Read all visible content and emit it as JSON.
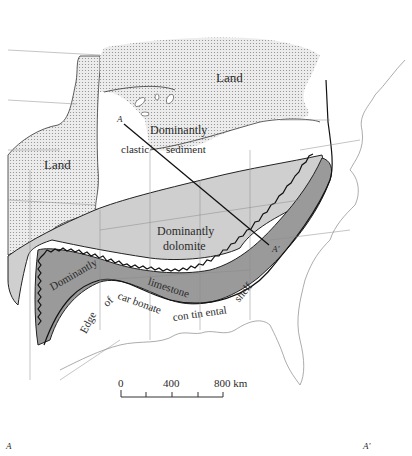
{
  "map": {
    "type": "paleogeographic facies map",
    "region": "Eastern and central United States",
    "colors": {
      "land_stipple": "#c8c8c8",
      "clastic": "#ffffff",
      "dolomite": "#cfcfcf",
      "limestone": "#9a9a9a",
      "boundary": "#222222",
      "state_lines": "#7a7a7a"
    },
    "labels": {
      "land_north": "Land",
      "land_west": "Land",
      "clastic_line1": "Dominantly",
      "clastic_line2a": "clastic",
      "clastic_line2b": "sediment",
      "dolomite_line1": "Dominantly",
      "dolomite_line2": "dolomite",
      "limestone_a": "Dominantly",
      "limestone_b": "limestone",
      "shelf_1": "Edge",
      "shelf_2": "of",
      "shelf_3": "car bonate",
      "shelf_4": "con tin ental",
      "shelf_5": "shelf",
      "section_start": "A",
      "section_end": "A'"
    },
    "scale_bar": {
      "ticks": [
        "0",
        "400",
        "800 km"
      ],
      "subdivisions": 4
    },
    "cross_section": {
      "left_label": "A",
      "right_label": "A'"
    }
  }
}
